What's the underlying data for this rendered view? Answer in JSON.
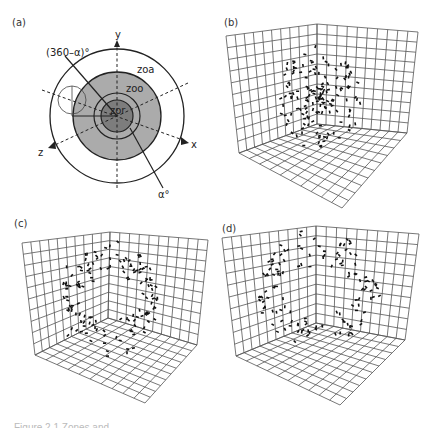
{
  "figure": {
    "panels": [
      {
        "id": "a",
        "label": "(a)"
      },
      {
        "id": "b",
        "label": "(b)"
      },
      {
        "id": "c",
        "label": "(c)"
      },
      {
        "id": "d",
        "label": "(d)"
      }
    ],
    "panel_a": {
      "axis_labels": {
        "y": "y",
        "x": "x",
        "z": "z"
      },
      "zone_labels": {
        "zoa": "zoa",
        "zoo": "zoo",
        "zor": "zor"
      },
      "angle_labels": {
        "blind": "(360–α)°",
        "alpha": "α°"
      },
      "colors": {
        "zoo": "#ababab",
        "zor": "#7d7d7d",
        "outline": "#222222"
      }
    },
    "grid": {
      "divisions": 10,
      "line_color": "#555555"
    },
    "caption": "Figure 2.1  Zones and"
  }
}
